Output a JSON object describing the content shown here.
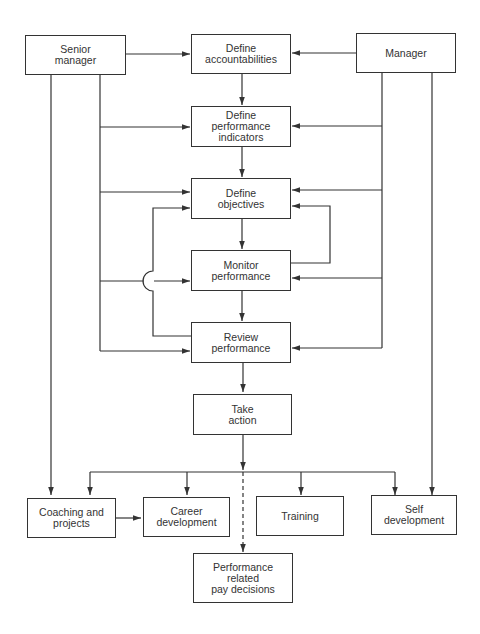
{
  "diagram": {
    "colors": {
      "line": "#333333",
      "background": "#ffffff",
      "text": "#333333"
    },
    "nodes": {
      "senior_manager": {
        "label": "Senior\nmanager"
      },
      "manager": {
        "label": "Manager"
      },
      "define_accountabilities": {
        "label": "Define\naccountabilities"
      },
      "define_performance_indicators": {
        "label": "Define\nperformance\nindicators"
      },
      "define_objectives": {
        "label": "Define\nobjectives"
      },
      "monitor_performance": {
        "label": "Monitor\nperformance"
      },
      "review_performance": {
        "label": "Review\nperformance"
      },
      "take_action": {
        "label": "Take\naction"
      },
      "coaching_and_projects": {
        "label": "Coaching and\nprojects"
      },
      "career_development": {
        "label": "Career\ndevelopment"
      },
      "training": {
        "label": "Training"
      },
      "self_development": {
        "label": "Self\ndevelopment"
      },
      "performance_related_pay": {
        "label": "Performance\nrelated\npay decisions"
      }
    },
    "edges": [
      {
        "from": "senior_manager",
        "to": "define_accountabilities",
        "style": "solid"
      },
      {
        "from": "manager",
        "to": "define_accountabilities",
        "style": "solid"
      },
      {
        "from": "define_accountabilities",
        "to": "define_performance_indicators",
        "style": "solid"
      },
      {
        "from": "senior_manager",
        "to": "define_performance_indicators",
        "style": "solid"
      },
      {
        "from": "manager",
        "to": "define_performance_indicators",
        "style": "solid"
      },
      {
        "from": "define_performance_indicators",
        "to": "define_objectives",
        "style": "solid"
      },
      {
        "from": "senior_manager",
        "to": "define_objectives",
        "style": "solid"
      },
      {
        "from": "manager",
        "to": "define_objectives",
        "style": "solid"
      },
      {
        "from": "define_objectives",
        "to": "monitor_performance",
        "style": "solid"
      },
      {
        "from": "monitor_performance",
        "to": "define_objectives",
        "style": "solid",
        "note": "feedback loop (right)"
      },
      {
        "from": "senior_manager",
        "to": "monitor_performance",
        "style": "solid"
      },
      {
        "from": "manager",
        "to": "monitor_performance",
        "style": "solid"
      },
      {
        "from": "monitor_performance",
        "to": "review_performance",
        "style": "solid"
      },
      {
        "from": "review_performance",
        "to": "define_objectives",
        "style": "solid",
        "note": "feedback loop (left), crosses line with hop"
      },
      {
        "from": "senior_manager",
        "to": "review_performance",
        "style": "solid"
      },
      {
        "from": "manager",
        "to": "review_performance",
        "style": "solid"
      },
      {
        "from": "review_performance",
        "to": "take_action",
        "style": "solid"
      },
      {
        "from": "take_action",
        "to": "coaching_and_projects",
        "style": "solid"
      },
      {
        "from": "take_action",
        "to": "career_development",
        "style": "solid"
      },
      {
        "from": "take_action",
        "to": "training",
        "style": "solid"
      },
      {
        "from": "take_action",
        "to": "self_development",
        "style": "solid"
      },
      {
        "from": "take_action",
        "to": "performance_related_pay",
        "style": "dashed"
      },
      {
        "from": "senior_manager",
        "to": "coaching_and_projects",
        "style": "solid"
      },
      {
        "from": "manager",
        "to": "self_development",
        "style": "solid"
      },
      {
        "from": "coaching_and_projects",
        "to": "career_development",
        "style": "solid"
      }
    ]
  }
}
